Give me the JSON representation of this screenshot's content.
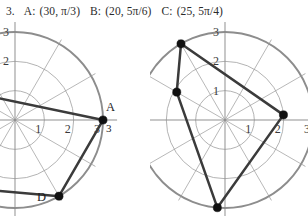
{
  "header": {
    "question_number": "3.",
    "items": [
      {
        "label": "A:",
        "value": "(30, π/3)"
      },
      {
        "label": "B:",
        "value": "(20, 5π/6)"
      },
      {
        "label": "C:",
        "value": "(25, 5π/4)"
      }
    ]
  },
  "colors": {
    "grid_line": "#9a9a9a",
    "grid_outer": "#8d8d8d",
    "axis_line": "#8a8a8a",
    "data_line": "#3b3b3b",
    "point_fill": "#111111",
    "text": "#1e1e1e",
    "background": "#ffffff"
  },
  "chart_data": [
    {
      "type": "scatter",
      "name": "left-polar-plot",
      "coordinate_system": "polar",
      "grid": true,
      "radial_ticks": [
        1,
        2,
        3
      ],
      "radial_tick_labels_x_axis": [
        "1",
        "2",
        "3"
      ],
      "radial_tick_labels_y_axis": [
        "2",
        "3"
      ],
      "angular_divisions": 12,
      "angular_step_degrees": 30,
      "rlim": [
        0,
        3
      ],
      "clipped_left_edge": true,
      "points": [
        {
          "label": "A",
          "r": 3,
          "theta_deg": 0,
          "label_pos": "above",
          "value_label": "3"
        },
        {
          "label": "D",
          "r": 3,
          "theta_deg": -60,
          "label_pos": "left"
        }
      ],
      "segments": [
        {
          "from": "A",
          "to": "offscreen-upper-left"
        },
        {
          "from": "A",
          "to": "D"
        },
        {
          "from": "D",
          "to": "offscreen-lower-left"
        }
      ]
    },
    {
      "type": "scatter",
      "name": "right-polar-plot",
      "coordinate_system": "polar",
      "grid": true,
      "radial_ticks": [
        1,
        2,
        3
      ],
      "radial_tick_labels_x_axis": [
        "1",
        "2",
        "3"
      ],
      "radial_tick_labels_y_axis": [
        "1",
        "2",
        "3"
      ],
      "angular_divisions": 12,
      "angular_step_degrees": 30,
      "rlim": [
        0,
        3
      ],
      "clipped_left_edge": false,
      "points": [
        {
          "label": "",
          "r": 3,
          "theta_deg": 120
        },
        {
          "label": "",
          "r": 1.9,
          "theta_deg": 150
        },
        {
          "label": "",
          "r": 2,
          "theta_deg": 5
        },
        {
          "label": "",
          "r": 3,
          "theta_deg": 265
        }
      ],
      "segments": [
        {
          "from": 0,
          "to": 1
        },
        {
          "from": 1,
          "to": 3
        },
        {
          "from": 3,
          "to": 2
        },
        {
          "from": 2,
          "to": 0
        }
      ]
    }
  ]
}
